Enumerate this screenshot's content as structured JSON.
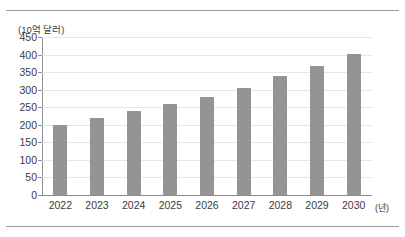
{
  "chart_data": {
    "type": "bar",
    "title": "",
    "subtitle": "",
    "categories": [
      "2022",
      "2023",
      "2024",
      "2025",
      "2026",
      "2027",
      "2028",
      "2029",
      "2030"
    ],
    "values": [
      200,
      218,
      238,
      258,
      280,
      305,
      338,
      368,
      402
    ],
    "series": [
      {
        "name": "",
        "values": [
          200,
          218,
          238,
          258,
          280,
          305,
          338,
          368,
          402
        ]
      }
    ],
    "xlabel": "(년)",
    "ylabel": "(10억 달러)",
    "ylim": [
      0,
      450
    ],
    "yticks": [
      0,
      50,
      100,
      150,
      200,
      250,
      300,
      350,
      400,
      450
    ],
    "ytick_labels": [
      "0",
      "50",
      "100",
      "150",
      "200",
      "250",
      "300",
      "350",
      "400",
      "450"
    ],
    "grid": true,
    "legend": "none",
    "bar_color": "#949494",
    "axis_color": "#8d8d8d",
    "grid_color": "#e6e6e6",
    "text_color": "#3b3b3b",
    "background": "#ffffff"
  },
  "figure": {
    "y_unit_caption": "(10억 달러)",
    "x_unit_caption": "(년)"
  }
}
